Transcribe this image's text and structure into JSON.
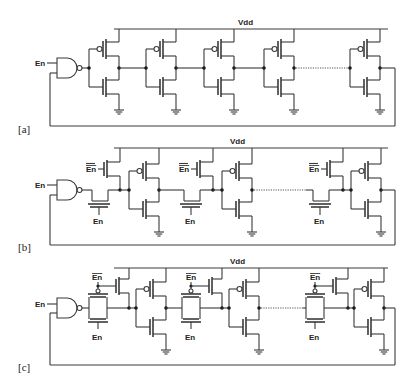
{
  "figure": {
    "panels": [
      {
        "id": "a",
        "tag": "[a]",
        "supply_label": "Vdd",
        "input_label": "En",
        "structure": "NAND + chain of CMOS inverters (ring)"
      },
      {
        "id": "b",
        "tag": "[b]",
        "supply_label": "Vdd",
        "input_label": "En",
        "pass_gate_label": "En",
        "pullup_label": "En̄",
        "structure": "NAND + NMOS pass gates with PMOS pull-ups between inverters"
      },
      {
        "id": "c",
        "tag": "[c]",
        "supply_label": "Vdd",
        "input_label": "En",
        "pass_gate_label": "En",
        "pullup_label": "En̄",
        "structure": "NAND + CMOS transmission gates with PMOS pull-ups between inverters"
      }
    ]
  },
  "labels": {
    "vdd": "Vdd",
    "en": "En",
    "en_bar": "En",
    "tag_a": "[a]",
    "tag_b": "[b]",
    "tag_c": "[c]"
  }
}
